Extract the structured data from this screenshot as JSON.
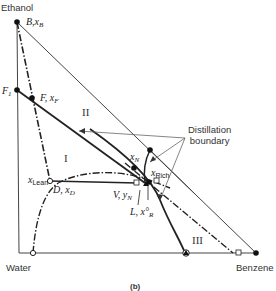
{
  "figure": {
    "caption": "(b)",
    "vertices": {
      "top": "Ethanol",
      "bottom_left": "Water",
      "bottom_right": "Benzene"
    },
    "points": {
      "B": {
        "name": "B",
        "var": "x",
        "sub": "B"
      },
      "F1": {
        "name": "F",
        "sub": "1"
      },
      "F": {
        "name": "F",
        "var": "x",
        "sub": "F"
      },
      "D": {
        "name": "D",
        "var": "x",
        "sub": "D"
      },
      "V": {
        "name": "V",
        "var": "y",
        "sub": "N"
      },
      "L": {
        "name": "L",
        "var": "x°",
        "sub": "R"
      },
      "xN": {
        "var": "x",
        "sub": "N"
      },
      "xLean": {
        "var": "x",
        "sub": "Lean"
      },
      "xRich": {
        "var": "x",
        "sub": "Rich"
      }
    },
    "regions": [
      "I",
      "II",
      "III"
    ],
    "annotation": "Distillation\nboundary",
    "annotation_lines": [
      "Distillation",
      "boundary"
    ],
    "colors": {
      "line": "#222222",
      "thin_line": "#555555",
      "background": "#ffffff"
    }
  }
}
